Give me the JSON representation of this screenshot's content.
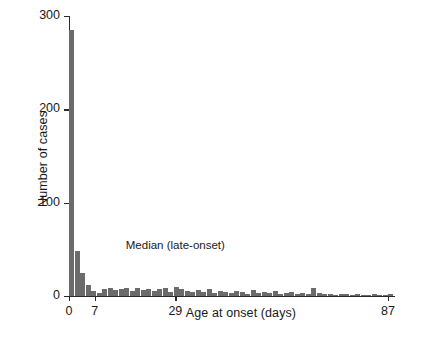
{
  "chart_data": {
    "type": "bar",
    "title": "",
    "xlabel": "Age at onset (days)",
    "ylabel": "Number of cases",
    "xlim": [
      0,
      90
    ],
    "ylim": [
      0,
      300
    ],
    "xticks": [
      0,
      7,
      29,
      87
    ],
    "xtick_labels": [
      "0",
      "7",
      "29",
      "87"
    ],
    "yticks": [
      0,
      100,
      200,
      300
    ],
    "ytick_labels": [
      "0",
      "100",
      "200",
      "300"
    ],
    "grid": false,
    "legend": "none",
    "bin_width": 1.5,
    "bar_color": "#6b6b6b",
    "axis_color": "#2b2b2b",
    "annotations": [
      {
        "text": "Median (late-onset)",
        "x": 29,
        "y": 55
      }
    ],
    "x": [
      0,
      1.5,
      3,
      4.5,
      6,
      7.5,
      9,
      10.5,
      12,
      13.5,
      15,
      16.5,
      18,
      19.5,
      21,
      22.5,
      24,
      25.5,
      27,
      28.5,
      30,
      31.5,
      33,
      34.5,
      36,
      37.5,
      39,
      40.5,
      42,
      43.5,
      45,
      46.5,
      48,
      49.5,
      51,
      52.5,
      54,
      55.5,
      57,
      58.5,
      60,
      61.5,
      63,
      64.5,
      66,
      67.5,
      69,
      70.5,
      72,
      73.5,
      75,
      76.5,
      78,
      79.5,
      81,
      82.5,
      84,
      85.5,
      87
    ],
    "values": [
      285,
      48,
      25,
      12,
      5,
      3,
      7,
      9,
      6,
      8,
      9,
      5,
      9,
      6,
      8,
      5,
      7,
      9,
      4,
      10,
      7,
      5,
      4,
      6,
      4,
      7,
      3,
      5,
      4,
      3,
      5,
      4,
      2,
      6,
      3,
      4,
      3,
      5,
      2,
      3,
      4,
      2,
      3,
      2,
      9,
      3,
      2,
      2,
      1,
      2,
      2,
      1,
      2,
      1,
      1,
      2,
      1,
      1,
      2
    ]
  }
}
